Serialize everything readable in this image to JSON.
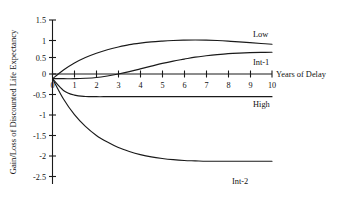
{
  "chart_data": {
    "type": "line",
    "title": "",
    "xlabel": "Years of Delay",
    "ylabel": "Gain/Loss of Discounted Life Expectancy",
    "xlim": [
      0,
      10
    ],
    "ylim": [
      -2.5,
      1.5
    ],
    "grid": false,
    "legend_position": "inline-right-of-curve",
    "x_ticks": [
      "0",
      "1",
      "2",
      "3",
      "4",
      "5",
      "6",
      "7",
      "8",
      "9",
      "10"
    ],
    "y_ticks": [
      "1.5",
      "1",
      "0.5",
      "0",
      "-0.5",
      "-1",
      "-1.5",
      "-2",
      "-2.5"
    ],
    "x": [
      0,
      0.5,
      1,
      1.5,
      2,
      2.5,
      3,
      3.5,
      4,
      4.5,
      5,
      5.5,
      6,
      6.5,
      7,
      7.5,
      8,
      8.5,
      9,
      9.5,
      10
    ],
    "series": [
      {
        "name": "Low",
        "label": "Low",
        "color": "#1a1a1a",
        "values": [
          0,
          0.22,
          0.4,
          0.54,
          0.65,
          0.74,
          0.81,
          0.87,
          0.91,
          0.94,
          0.96,
          0.975,
          0.985,
          0.99,
          0.985,
          0.975,
          0.96,
          0.94,
          0.92,
          0.9,
          0.88
        ]
      },
      {
        "name": "Int-1",
        "label": "Int-1",
        "color": "#1a1a1a",
        "values": [
          0,
          0.0,
          0.0,
          0.01,
          0.03,
          0.07,
          0.12,
          0.18,
          0.25,
          0.32,
          0.39,
          0.45,
          0.5,
          0.55,
          0.585,
          0.615,
          0.64,
          0.655,
          0.665,
          0.672,
          0.675
        ]
      },
      {
        "name": "High",
        "label": "High",
        "color": "#1a1a1a",
        "values": [
          0,
          -0.3,
          -0.42,
          -0.455,
          -0.46,
          -0.46,
          -0.46,
          -0.46,
          -0.46,
          -0.46,
          -0.46,
          -0.46,
          -0.46,
          -0.46,
          -0.46,
          -0.46,
          -0.46,
          -0.46,
          -0.46,
          -0.46,
          -0.46
        ]
      },
      {
        "name": "Int-2",
        "label": "Int-2",
        "color": "#1a1a1a",
        "values": [
          0,
          -0.52,
          -0.92,
          -1.22,
          -1.45,
          -1.62,
          -1.76,
          -1.86,
          -1.94,
          -2.0,
          -2.04,
          -2.07,
          -2.09,
          -2.1,
          -2.11,
          -2.11,
          -2.11,
          -2.11,
          -2.11,
          -2.11,
          -2.11
        ]
      }
    ],
    "annotations": [
      {
        "text": "Low",
        "x": 9.2,
        "y": 1.22
      },
      {
        "text": "Int-1",
        "x": 9.2,
        "y": 0.42
      },
      {
        "text": "High",
        "x": 9.2,
        "y": -0.73
      },
      {
        "text": "Int-2",
        "x": 8.1,
        "y": -2.42
      }
    ]
  },
  "axes": {
    "x_title": "Years of Delay",
    "y_title": "Gain/Loss of Discounted Life Expectancy"
  }
}
